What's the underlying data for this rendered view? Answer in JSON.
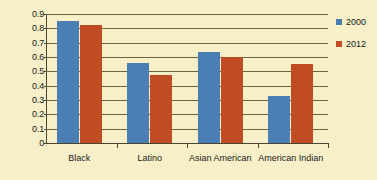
{
  "chart_data": {
    "type": "bar",
    "title": "",
    "xlabel": "",
    "ylabel": "",
    "ylim": [
      0,
      0.9
    ],
    "ytick_values": [
      0.9,
      0.8,
      0.7,
      0.6,
      0.5,
      0.4,
      0.3,
      0.2,
      0.1,
      0
    ],
    "ytick_labels": [
      "0.9",
      "0.8",
      "0.7",
      "0.6",
      "0.5",
      "0.4",
      "0.3",
      "0.2",
      "0.1",
      "0"
    ],
    "grid": true,
    "legend_position": "right",
    "categories": [
      "Black",
      "Latino",
      "Asian American",
      "American Indian"
    ],
    "series": [
      {
        "name": "2000",
        "color": "#4a7eb5",
        "values": [
          0.85,
          0.555,
          0.635,
          0.33
        ]
      },
      {
        "name": "2012",
        "color": "#bf4c22",
        "values": [
          0.825,
          0.475,
          0.6,
          0.55
        ]
      }
    ],
    "colors": {
      "background": "#f7efc8",
      "gridline": "#6b6347",
      "axis": "#4a452f",
      "text": "#1a1a1a"
    }
  }
}
